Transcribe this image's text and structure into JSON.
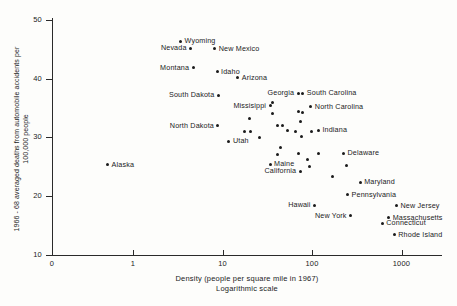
{
  "chart_data": {
    "type": "scatter",
    "title": "",
    "xlabel": "Density (people per square mile in 1967)",
    "xlabel_sub": "Logarithmic scale",
    "ylabel": "1966 - 68 averaged deaths from automobile accidents per 100,000 people",
    "xscale": "log",
    "yscale": "linear",
    "xlim": [
      0.3,
      3000
    ],
    "ylim": [
      10,
      51
    ],
    "grid": false,
    "legend": false,
    "xticks": [
      {
        "label": "0",
        "value": 0.33
      },
      {
        "label": "1",
        "value": 1
      },
      {
        "label": "10",
        "value": 10
      },
      {
        "label": "100",
        "value": 100
      },
      {
        "label": "1000",
        "value": 1000
      }
    ],
    "yticks": [
      {
        "label": "50",
        "value": 50
      },
      {
        "label": "40",
        "value": 40
      },
      {
        "label": "30",
        "value": 30
      },
      {
        "label": "20",
        "value": 20
      },
      {
        "label": "10",
        "value": 10
      }
    ],
    "points": [
      {
        "label": "Wyoming",
        "x": 3.4,
        "y": 46.4,
        "side": "right"
      },
      {
        "label": "Nevada",
        "x": 4.4,
        "y": 45.2,
        "side": "left"
      },
      {
        "label": "New Mexico",
        "x": 8.2,
        "y": 45.1,
        "side": "right"
      },
      {
        "label": "Montana",
        "x": 4.7,
        "y": 41.9,
        "side": "left"
      },
      {
        "label": "Idaho",
        "x": 8.7,
        "y": 41.2,
        "side": "right"
      },
      {
        "label": "Arizona",
        "x": 14.8,
        "y": 40.2,
        "side": "right"
      },
      {
        "label": "South Dakota",
        "x": 9.0,
        "y": 37.2,
        "side": "left"
      },
      {
        "label": "Georgia",
        "x": 70.0,
        "y": 37.5,
        "side": "above-left"
      },
      {
        "label": "South Carolina",
        "x": 79.0,
        "y": 37.5,
        "side": "right"
      },
      {
        "label": "Missisippi",
        "x": 34.0,
        "y": 35.4,
        "side": "left"
      },
      {
        "label": "North Carolina",
        "x": 97.0,
        "y": 35.2,
        "side": "right"
      },
      {
        "label": "North Dakota",
        "x": 8.9,
        "y": 32.0,
        "side": "left"
      },
      {
        "label": "Indiana",
        "x": 118.0,
        "y": 31.2,
        "side": "right"
      },
      {
        "label": "Utah",
        "x": 11.8,
        "y": 29.3,
        "side": "right"
      },
      {
        "label": "Alaska",
        "x": 0.52,
        "y": 25.3,
        "side": "right"
      },
      {
        "label": "Maine",
        "x": 34.0,
        "y": 25.4,
        "side": "right"
      },
      {
        "label": "California",
        "x": 74.0,
        "y": 24.2,
        "side": "above-left"
      },
      {
        "label": "Delaware",
        "x": 225.0,
        "y": 27.3,
        "side": "right"
      },
      {
        "label": "Maryland",
        "x": 345.0,
        "y": 22.3,
        "side": "right"
      },
      {
        "label": "Pennsylvania",
        "x": 250.0,
        "y": 20.2,
        "side": "right"
      },
      {
        "label": "Hawaii",
        "x": 107.0,
        "y": 18.4,
        "side": "left"
      },
      {
        "label": "New Jersey",
        "x": 880.0,
        "y": 18.3,
        "side": "right"
      },
      {
        "label": "New York",
        "x": 270.0,
        "y": 16.6,
        "side": "left"
      },
      {
        "label": "Massachusetts",
        "x": 720.0,
        "y": 16.3,
        "side": "right"
      },
      {
        "label": "Connecticut",
        "x": 610.0,
        "y": 15.3,
        "side": "right"
      },
      {
        "label": "Rhode Island",
        "x": 830.0,
        "y": 13.4,
        "side": "right"
      }
    ],
    "unlabeled_points": [
      {
        "x": 36.0,
        "y": 36.0
      },
      {
        "x": 71.0,
        "y": 34.5
      },
      {
        "x": 79.0,
        "y": 34.2
      },
      {
        "x": 36.0,
        "y": 34.1
      },
      {
        "x": 20.0,
        "y": 33.2
      },
      {
        "x": 75.0,
        "y": 32.8
      },
      {
        "x": 41.0,
        "y": 32.1
      },
      {
        "x": 47.0,
        "y": 32.1
      },
      {
        "x": 17.5,
        "y": 31.0
      },
      {
        "x": 20.5,
        "y": 31.0
      },
      {
        "x": 53.0,
        "y": 31.1
      },
      {
        "x": 66.0,
        "y": 31.0
      },
      {
        "x": 99.0,
        "y": 31.0
      },
      {
        "x": 76.0,
        "y": 30.1
      },
      {
        "x": 26.0,
        "y": 30.0
      },
      {
        "x": 44.0,
        "y": 28.2
      },
      {
        "x": 41.0,
        "y": 27.1
      },
      {
        "x": 71.0,
        "y": 27.2
      },
      {
        "x": 118.0,
        "y": 27.2
      },
      {
        "x": 90.0,
        "y": 26.2
      },
      {
        "x": 93.0,
        "y": 25.1
      },
      {
        "x": 245.0,
        "y": 25.2
      },
      {
        "x": 170.0,
        "y": 23.3
      }
    ]
  }
}
